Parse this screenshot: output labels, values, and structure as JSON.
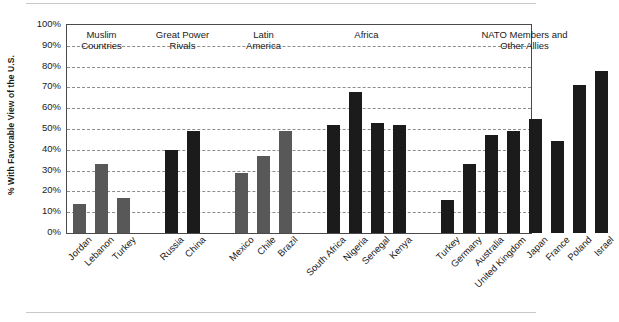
{
  "chart_data": {
    "type": "bar",
    "title": "",
    "xlabel": "",
    "ylabel": "% With Favorable View of the U.S.",
    "ylim": [
      0,
      100
    ],
    "ytick_labels": [
      "100%",
      "90%",
      "80%",
      "70%",
      "60%",
      "50%",
      "40%",
      "30%",
      "20%",
      "10%",
      "0%"
    ],
    "ytick_values": [
      100,
      90,
      80,
      70,
      60,
      50,
      40,
      30,
      20,
      10,
      0
    ],
    "grid": true,
    "legend": "none",
    "categories": [
      "Jordan",
      "Lebanon",
      "Turkey",
      "Russia",
      "China",
      "Mexico",
      "Chile",
      "Brazil",
      "South Africa",
      "Nigeria",
      "Senegal",
      "Kenya",
      "Turkey",
      "Germany",
      "Australia",
      "United Kingdom",
      "Japan",
      "France",
      "Poland",
      "Israel"
    ],
    "values": [
      14,
      33,
      17,
      40,
      49,
      29,
      37,
      49,
      52,
      68,
      53,
      52,
      16,
      33,
      47,
      49,
      55,
      44,
      71,
      78
    ],
    "bar_colors": [
      "#585858",
      "#585858",
      "#585858",
      "#1b1b1b",
      "#1b1b1b",
      "#585858",
      "#585858",
      "#585858",
      "#1b1b1b",
      "#1b1b1b",
      "#1b1b1b",
      "#1b1b1b",
      "#1b1b1b",
      "#1b1b1b",
      "#1b1b1b",
      "#1b1b1b",
      "#1b1b1b",
      "#1b1b1b",
      "#1b1b1b",
      "#1b1b1b"
    ],
    "groups": [
      {
        "label": "Muslim\nCountries",
        "start": 0,
        "end": 2
      },
      {
        "label": "Great Power\nRivals",
        "start": 3,
        "end": 4
      },
      {
        "label": "Latin\nAmerica",
        "start": 5,
        "end": 7
      },
      {
        "label": "Africa",
        "start": 8,
        "end": 11
      },
      {
        "label": "NATO Members and\nOther Allies",
        "start": 12,
        "end": 19
      }
    ],
    "colors": {
      "bar_gray": "#585858",
      "bar_black": "#1b1b1b",
      "grid": "#8d8d8d",
      "frame": "#4a4a4a",
      "background": "#ffffff"
    }
  }
}
